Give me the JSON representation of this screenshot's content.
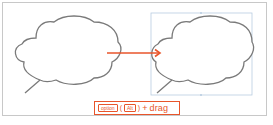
{
  "diagram": {
    "shapes": [
      {
        "type": "speech-bubble-cloud",
        "state": "original"
      },
      {
        "type": "speech-bubble-cloud",
        "state": "duplicated-selected"
      }
    ],
    "arrow_color": "#e8552b",
    "outline_color": "#7a7a7a",
    "selection_color": "#b8cce0"
  },
  "caption": {
    "key_mac": "option",
    "paren_open": "(",
    "key_win": "Alt",
    "paren_close": ")",
    "plus": "+",
    "action": "drag"
  }
}
